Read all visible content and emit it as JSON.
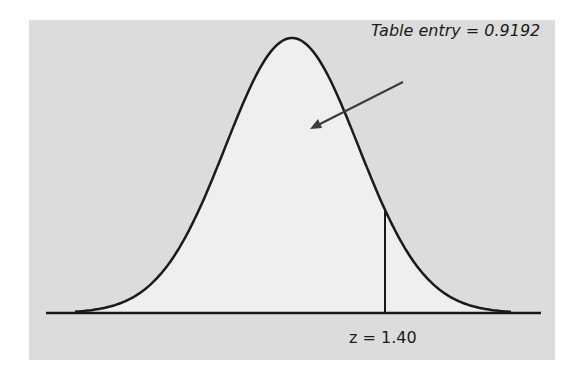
{
  "figure": {
    "annotation": "Table entry = 0.9192",
    "z_label": "z = 1.40",
    "colors": {
      "panel_bg": "#dcdcdc",
      "curve_fill": "#efefef",
      "stroke": "#1a1a1a"
    }
  },
  "chart_data": {
    "type": "area",
    "title": "",
    "distribution": "standard normal",
    "shaded_region": "left of z",
    "z": 1.4,
    "cumulative_probability": 0.9192,
    "annotations": [
      "Table entry = 0.9192",
      "z = 1.40"
    ],
    "grid": false
  }
}
